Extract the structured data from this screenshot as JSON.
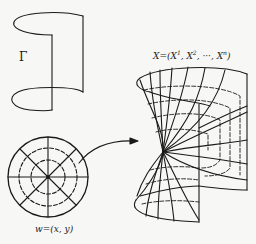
{
  "figure": {
    "curve_label": "Γ",
    "domain_label": "w=(x, y)",
    "map_label": "X=(X¹, X², ···, Xⁿ)",
    "map_label_parts": {
      "prefix": "X=(X",
      "s1": "1",
      "mid1": ", X",
      "s2": "2",
      "mid2": ", ···, X",
      "sn": "n",
      "suffix": ")"
    },
    "elements": [
      {
        "name": "boundary-curve-gamma",
        "description": "Open cylindrical space curve Γ with top and bottom elliptical arcs"
      },
      {
        "name": "unit-disk",
        "description": "Polar grid disk with solid radial lines and dashed concentric circles"
      },
      {
        "name": "mapping-arrow",
        "description": "Curved arrow from disk to surface"
      },
      {
        "name": "minimal-surface",
        "description": "Saddle/catenoid-like surface spanning Γ with mapped grid lines"
      }
    ],
    "colors": {
      "ink": "#1a1a1a",
      "paper": "#f7f7f5"
    }
  }
}
